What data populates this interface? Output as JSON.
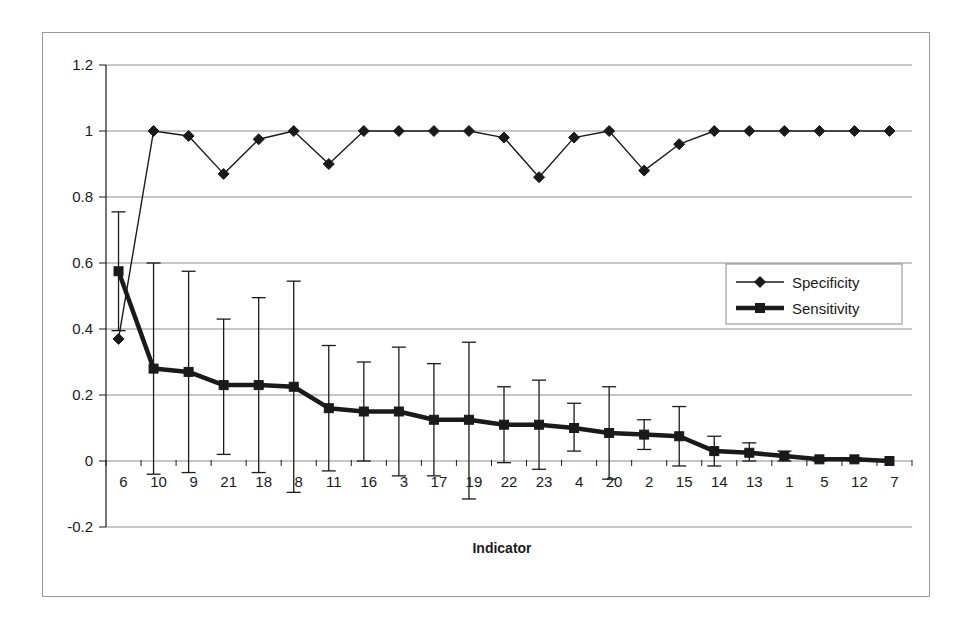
{
  "figure": {
    "background_color": "#ffffff",
    "frame_color": "#9a9a9a",
    "ink_color": "#1a1a1a",
    "gridline_color": "#8c8c8c"
  },
  "chart_data": {
    "type": "line",
    "title": "",
    "subtitle": "",
    "xlabel": "Indicator",
    "ylabel": "",
    "ylim": [
      -0.2,
      1.2
    ],
    "ytick_labels": [
      "1.2",
      "1",
      "0.8",
      "0.6",
      "0.4",
      "0.2",
      "0",
      "-0.2"
    ],
    "ytick_values": [
      1.2,
      1,
      0.8,
      0.6,
      0.4,
      0.2,
      0,
      -0.2
    ],
    "grid": "horizontal",
    "legend_position": "center-right",
    "categories": [
      "6",
      "10",
      "9",
      "21",
      "18",
      "8",
      "11",
      "16",
      "3",
      "17",
      "19",
      "22",
      "23",
      "4",
      "20",
      "2",
      "15",
      "14",
      "13",
      "1",
      "5",
      "12",
      "7"
    ],
    "series": [
      {
        "name": "Specificity",
        "marker": "diamond",
        "line_width": 1.4,
        "color": "#1a1a1a",
        "has_error_bars": false,
        "values": [
          0.37,
          1.0,
          0.985,
          0.87,
          0.975,
          1.0,
          0.9,
          1.0,
          1.0,
          1.0,
          1.0,
          0.98,
          0.86,
          0.98,
          1.0,
          0.88,
          0.96,
          1.0,
          1.0,
          1.0,
          1.0,
          1.0,
          1.0
        ]
      },
      {
        "name": "Sensitivity",
        "marker": "square",
        "line_width": 4.5,
        "color": "#1a1a1a",
        "has_error_bars": true,
        "values": [
          0.575,
          0.28,
          0.27,
          0.23,
          0.23,
          0.225,
          0.16,
          0.15,
          0.15,
          0.125,
          0.125,
          0.11,
          0.11,
          0.1,
          0.085,
          0.08,
          0.075,
          0.03,
          0.025,
          0.015,
          0.005,
          0.005,
          0.0
        ],
        "error_upper": [
          0.755,
          0.6,
          0.575,
          0.43,
          0.495,
          0.545,
          0.35,
          0.3,
          0.345,
          0.295,
          0.36,
          0.225,
          0.245,
          0.175,
          0.225,
          0.125,
          0.165,
          0.075,
          0.055,
          0.03,
          0.01,
          0.01,
          0.0
        ],
        "error_lower": [
          0.395,
          -0.04,
          -0.035,
          0.02,
          -0.035,
          -0.095,
          -0.03,
          0.0,
          -0.045,
          -0.045,
          -0.115,
          -0.005,
          -0.025,
          0.03,
          -0.055,
          0.035,
          -0.015,
          -0.015,
          0.0,
          0.0,
          0.0,
          0.0,
          0.0
        ]
      }
    ]
  },
  "legend": {
    "items": [
      {
        "label": "Specificity",
        "marker": "diamond",
        "line_width": 1.4
      },
      {
        "label": "Sensitivity",
        "marker": "square",
        "line_width": 4.5
      }
    ]
  }
}
